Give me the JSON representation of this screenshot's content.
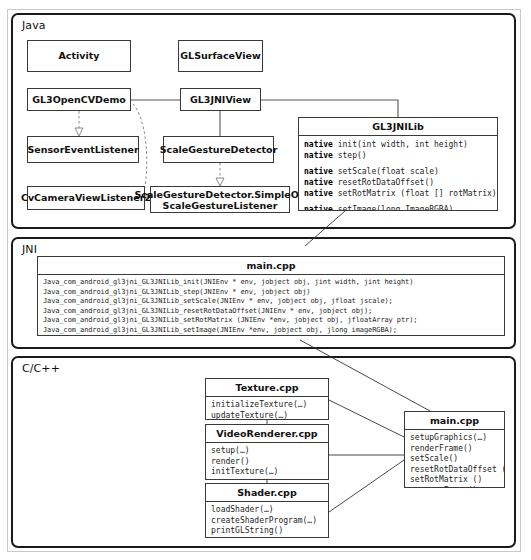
{
  "diagram": {
    "layers": [
      {
        "id": "java",
        "label": "Java"
      },
      {
        "id": "jni",
        "label": "JNI"
      },
      {
        "id": "cpp",
        "label": "C/C++"
      }
    ]
  },
  "java": {
    "classes": {
      "activity": "Activity",
      "glsurfaceview": "GLSurfaceView",
      "gl3opencvdemo": "GL3OpenCVDemo",
      "gl3jniview": "GL3JNIView",
      "sensoreventlistener": "SensorEventListener",
      "scalegesturedetector": "ScaleGestureDetector",
      "cvcameraviewlistener2": "CvCameraViewListener2",
      "simpleonscalegesturelistener_line1": "ScaleGestureDetector.SimpleOn",
      "simpleonscalegesturelistener_line2": "ScaleGestureListener"
    },
    "gl3jnilib": {
      "title": "GL3JNILib",
      "members": [
        {
          "kw": "native",
          "sig": " init(int width, int height)"
        },
        {
          "kw": "native",
          "sig": " step()"
        },
        {
          "blank": true
        },
        {
          "kw": "native",
          "sig": " setScale(float scale)"
        },
        {
          "kw": "native",
          "sig": " resetRotDataOffset()"
        },
        {
          "kw": "native",
          "sig": " setRotMatrix (float [] rotMatrix)"
        },
        {
          "blank": true
        },
        {
          "kw": "native",
          "sig": " setImage(long ImageRGBA)"
        }
      ]
    }
  },
  "jni": {
    "main_cpp": {
      "title": "main.cpp",
      "functions": [
        "Java_com_android_gl3jni_GL3JNILib_init(JNIEnv * env, jobject obj, jint width, jint height)",
        "Java_com_android_gl3jni_GL3JNILib_step(JNIEnv * env, jobject obj)",
        "Java_com_android_gl3jni_GL3JNILib_setScale(JNIEnv * env, jobject obj, jfloat jscale);",
        "Java_com_android_gl3jni_GL3JNILib_resetRotDataOffset(JNIEnv * env, jobject obj);",
        "Java_com_android_gl3jni_GL3JNILib_setRotMatrix (JNIEnv *env, jobject obj, jfloatArray ptr);",
        "Java_com_android_gl3jni_GL3JNILib_setImage(JNIEnv *env, jobject obj, jlong imageRGBA);"
      ]
    }
  },
  "cpp": {
    "texture": {
      "title": "Texture.cpp",
      "functions": [
        "initializeTexture(…)",
        "updateTexture(…)"
      ]
    },
    "videorenderer": {
      "title": "VideoRenderer.cpp",
      "functions": [
        "setup(…)",
        "render()",
        "initTexture(…)"
      ]
    },
    "shader": {
      "title": "Shader.cpp",
      "functions": [
        "loadShader(…)",
        "createShaderProgram(…)",
        "printGLString()",
        "checkGlError()"
      ]
    },
    "main": {
      "title": "main.cpp",
      "functions": [
        "setupGraphics(…)",
        "renderFrame()",
        "setScale()",
        "resetRotDataOffset ()",
        "setRotMatrix ()",
        "processFrame()"
      ]
    }
  },
  "colors": {
    "frame": "#c9c9c9",
    "layer_border": "#1a1a1a",
    "class_border": "#3a3a3a",
    "connector": "#555555",
    "dashed_connector": "#888888",
    "text": "#111111",
    "background": "#ffffff"
  }
}
